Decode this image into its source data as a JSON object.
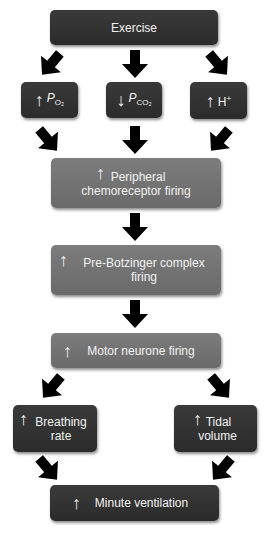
{
  "diagram": {
    "type": "flowchart",
    "nodes": [
      {
        "id": "exercise",
        "label": "Exercise",
        "style": "dark"
      },
      {
        "id": "po2",
        "prefix": "↑",
        "label": "P",
        "subscript": "O₂",
        "style": "dark"
      },
      {
        "id": "pco2",
        "prefix": "↓",
        "label": "P",
        "subscript": "CO₂",
        "style": "dark"
      },
      {
        "id": "h",
        "prefix": "↑",
        "label": "H",
        "superscript": "+",
        "style": "dark"
      },
      {
        "id": "peripheral",
        "prefix": "↑",
        "line1": "Peripheral",
        "line2": "chemoreceptor firing",
        "style": "grey"
      },
      {
        "id": "prebotz",
        "prefix": "↑",
        "line1": "Pre-Botzinger complex",
        "line2": "firing",
        "style": "grey"
      },
      {
        "id": "motor",
        "prefix": "↑",
        "label": "Motor neurone firing",
        "style": "grey"
      },
      {
        "id": "breathing",
        "prefix": "↑",
        "line1": "Breathing",
        "line2": "rate",
        "style": "dark"
      },
      {
        "id": "tidal",
        "prefix": "↑",
        "line1": "Tidal",
        "line2": "volume",
        "style": "dark"
      },
      {
        "id": "minute",
        "prefix": "↑",
        "label": "Minute ventilation",
        "style": "dark"
      }
    ],
    "edges": [
      [
        "exercise",
        "po2"
      ],
      [
        "exercise",
        "pco2"
      ],
      [
        "exercise",
        "h"
      ],
      [
        "po2",
        "peripheral"
      ],
      [
        "pco2",
        "peripheral"
      ],
      [
        "h",
        "peripheral"
      ],
      [
        "peripheral",
        "prebotz"
      ],
      [
        "prebotz",
        "motor"
      ],
      [
        "motor",
        "breathing"
      ],
      [
        "motor",
        "tidal"
      ],
      [
        "breathing",
        "minute"
      ],
      [
        "tidal",
        "minute"
      ]
    ],
    "colors": {
      "dark_box": "#323232",
      "grey_box": "#727272",
      "arrow": "#000000",
      "text": "#f2f2f2"
    }
  }
}
